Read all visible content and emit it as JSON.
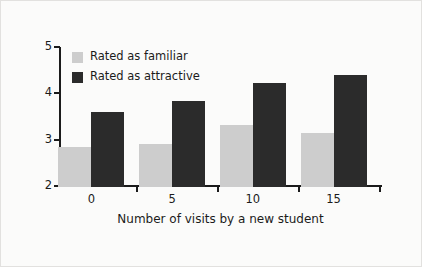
{
  "chart_data": {
    "type": "bar",
    "title": "",
    "subtitle": "",
    "xlabel": "Number of visits by a new student",
    "ylabel": "",
    "categories": [
      "0",
      "5",
      "10",
      "15"
    ],
    "series": [
      {
        "name": "Rated as familiar",
        "color": "#cdcdcd",
        "values": [
          2.86,
          2.93,
          3.34,
          3.17
        ]
      },
      {
        "name": "Rated as attractive",
        "color": "#2b2b2b",
        "values": [
          3.62,
          3.86,
          4.25,
          4.42
        ]
      }
    ],
    "ylim": [
      2,
      5
    ],
    "yticks": [
      "2",
      "3",
      "4",
      "5"
    ],
    "xticks": [
      "0",
      "5",
      "10",
      "15"
    ],
    "grid": false,
    "legend_position": "top-left"
  },
  "legend": {
    "items": [
      {
        "label": "Rated as familiar",
        "swatch": "familiar-swatch"
      },
      {
        "label": "Rated as attractive",
        "swatch": "attractive-swatch"
      }
    ]
  },
  "axes": {
    "x_title": "Number of visits by a new student"
  }
}
